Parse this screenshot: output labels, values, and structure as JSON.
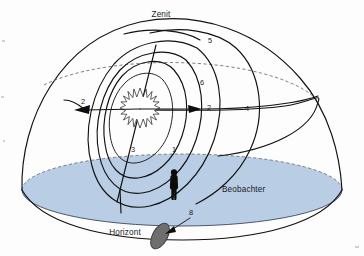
{
  "figure": {
    "language": "de",
    "background_color": "#fdfdfd"
  },
  "colors": {
    "sky_dome_stroke": "#111111",
    "horizon_fill": "#b9cde4",
    "horizon_stroke": "#3b4a5e",
    "dashed_stroke": "#6a6a72",
    "silhouette": "#0b0b0b",
    "shadow_fill": "#6e6e6e",
    "label_text": "#1b1b1b"
  },
  "labels": {
    "zenith": "Zenit",
    "horizon": "Horizont",
    "observer": "Beobachter"
  },
  "markers": [
    {
      "id": "m1",
      "text": "1",
      "x": 174,
      "y": 152,
      "meaning": "tagesbahn-sonne"
    },
    {
      "id": "m2a",
      "text": "2",
      "x": 83,
      "y": 104,
      "meaning": "bewegungsrichtung-links"
    },
    {
      "id": "m2b",
      "text": "2",
      "x": 209,
      "y": 110,
      "meaning": "bewegungsrichtung-rechts"
    },
    {
      "id": "m3",
      "text": "3",
      "x": 133,
      "y": 152,
      "meaning": "himmelsachse-fusspunkt"
    },
    {
      "id": "m4",
      "text": "4",
      "x": 247,
      "y": 111,
      "meaning": "himmelsaequator"
    },
    {
      "id": "m5",
      "text": "5",
      "x": 210,
      "y": 43,
      "meaning": "meridian"
    },
    {
      "id": "m6",
      "text": "6",
      "x": 202,
      "y": 85,
      "meaning": "nebenkreis"
    },
    {
      "id": "m8",
      "text": "8",
      "x": 191,
      "y": 215,
      "meaning": "schattenscheibe"
    }
  ],
  "elements": {
    "sun": {
      "name": "sonne",
      "cx": 140,
      "cy": 108,
      "radius": 20
    },
    "observer_figure": {
      "name": "beobachter-silhouette",
      "x": 174,
      "y": 178
    },
    "shadow_disc": {
      "name": "schatten-ellipse",
      "cx": 160,
      "cy": 236
    },
    "arrow_left": {
      "name": "pfeil-links",
      "tip_x": 74,
      "tip_y": 110
    },
    "arrow_right": {
      "name": "pfeil-rechts",
      "tip_x": 202,
      "tip_y": 109
    },
    "arrow_to_disc": {
      "name": "pfeil-zur-scheibe",
      "from_x": 188,
      "from_y": 219,
      "to_x": 166,
      "to_y": 232
    }
  }
}
